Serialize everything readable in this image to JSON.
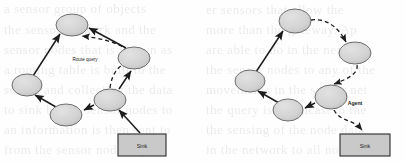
{
  "figure": {
    "background_color": "#fefefe",
    "node_fill": "#d2d2d2",
    "node_stroke": "#6e6e6e",
    "box_fill": "#c9c9c9",
    "box_stroke": "#3a3a3a",
    "arrow_color": "#1c1c1c",
    "text_color": "#1c1c1c"
  },
  "left_diagram": {
    "name": "route-query-diagram",
    "nodes": [
      {
        "id": "L1",
        "label": "",
        "cx": 72,
        "cy": 25,
        "rx": 16,
        "ry": 11
      },
      {
        "id": "L2",
        "label": "",
        "cx": 134,
        "cy": 58,
        "rx": 16,
        "ry": 11
      },
      {
        "id": "L3",
        "label": "",
        "cx": 110,
        "cy": 100,
        "rx": 16,
        "ry": 11
      },
      {
        "id": "L4",
        "label": "",
        "cx": 66,
        "cy": 115,
        "rx": 16,
        "ry": 11
      },
      {
        "id": "L5",
        "label": "",
        "cx": 27,
        "cy": 85,
        "rx": 15,
        "ry": 11
      }
    ],
    "sink_box": {
      "label": "Sink",
      "x": 118,
      "y": 134,
      "width": 48,
      "height": 22
    },
    "edge_label": {
      "text": "Route query",
      "x": 85,
      "y": 61
    },
    "solid_edges": [
      {
        "from": "L5",
        "to": "L1"
      },
      {
        "from": "L4",
        "to": "L5"
      },
      {
        "from": "L3",
        "to": "L4"
      },
      {
        "from": "L2",
        "to": "L1"
      },
      {
        "from": "L3",
        "to": "L2"
      },
      {
        "from": "sink",
        "to": "L3"
      }
    ],
    "dashed_edges": [
      {
        "from": "L3",
        "to": "L2",
        "style": "curve"
      },
      {
        "from": "L2",
        "to": "L1",
        "style": "curve"
      }
    ]
  },
  "right_diagram": {
    "name": "agent-diagram",
    "nodes": [
      {
        "id": "R1",
        "label": "",
        "cx": 295,
        "cy": 21,
        "rx": 16,
        "ry": 12
      },
      {
        "id": "R2",
        "label": "",
        "cx": 355,
        "cy": 53,
        "rx": 16,
        "ry": 11
      },
      {
        "id": "R3",
        "label": "",
        "cx": 331,
        "cy": 97,
        "rx": 16,
        "ry": 12
      },
      {
        "id": "R4",
        "label": "",
        "cx": 288,
        "cy": 110,
        "rx": 15,
        "ry": 11
      },
      {
        "id": "R5",
        "label": "",
        "cx": 250,
        "cy": 81,
        "rx": 15,
        "ry": 11
      }
    ],
    "sink_box": {
      "label": "Sink",
      "x": 340,
      "y": 134,
      "width": 50,
      "height": 22
    },
    "edge_label": {
      "text": "Agent",
      "x": 355,
      "y": 105
    },
    "solid_edges": [
      {
        "from": "R5",
        "to": "R1"
      },
      {
        "from": "R4",
        "to": "R5"
      },
      {
        "from": "R3",
        "to": "R4"
      }
    ],
    "dashed_edges": [
      {
        "from": "R1",
        "to": "R2",
        "style": "curve"
      },
      {
        "from": "R2",
        "to": "R3",
        "style": "curve"
      },
      {
        "from": "R3",
        "to": "sink",
        "style": "curve"
      }
    ]
  },
  "background_text": {
    "lines": [
      {
        "text": "er sensors that allow the",
        "x": 206,
        "y": 2,
        "size": 13
      },
      {
        "text": "a sensor group of objects",
        "x": 4,
        "y": 1,
        "size": 13
      },
      {
        "text": "more than the gateway. Ap",
        "x": 206,
        "y": 22,
        "size": 13
      },
      {
        "text": "the sensor network and the",
        "x": 4,
        "y": 22,
        "size": 13
      },
      {
        "text": "are able to do in the network",
        "x": 206,
        "y": 42,
        "size": 13
      },
      {
        "text": "sensor nodes that is known as",
        "x": 4,
        "y": 42,
        "size": 13
      },
      {
        "text": "the sensor nodes to any of the",
        "x": 206,
        "y": 62,
        "size": 13
      },
      {
        "text": "a routing table is built to the",
        "x": 4,
        "y": 62,
        "size": 13
      },
      {
        "text": "movements in the sensor net",
        "x": 206,
        "y": 82,
        "size": 13
      },
      {
        "text": "sensor and collecting the data",
        "x": 4,
        "y": 82,
        "size": 13
      },
      {
        "text": "the query is broadcast to the",
        "x": 206,
        "y": 102,
        "size": 13
      },
      {
        "text": "to sink by the sensor nodes to",
        "x": 4,
        "y": 102,
        "size": 13
      },
      {
        "text": "the sensing of the node data",
        "x": 206,
        "y": 122,
        "size": 13
      },
      {
        "text": "an information is then sent to",
        "x": 4,
        "y": 122,
        "size": 13
      },
      {
        "text": "in the network to all nodes",
        "x": 206,
        "y": 142,
        "size": 13
      },
      {
        "text": "from the sensor node region",
        "x": 4,
        "y": 142,
        "size": 13
      }
    ]
  }
}
